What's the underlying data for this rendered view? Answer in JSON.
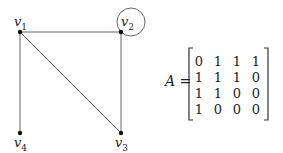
{
  "graph": {
    "vertices": [
      {
        "id": "v1",
        "name": "v",
        "sub": "1",
        "x": 20,
        "y": 32
      },
      {
        "id": "v2",
        "name": "v",
        "sub": "2",
        "x": 121,
        "y": 32
      },
      {
        "id": "v3",
        "name": "v",
        "sub": "3",
        "x": 121,
        "y": 133
      },
      {
        "id": "v4",
        "name": "v",
        "sub": "4",
        "x": 20,
        "y": 133
      }
    ],
    "edges": [
      [
        "v1",
        "v2"
      ],
      [
        "v1",
        "v3"
      ],
      [
        "v1",
        "v4"
      ],
      [
        "v2",
        "v3"
      ],
      [
        "v2",
        "v2"
      ]
    ],
    "edge_color": "#555555"
  },
  "matrix": {
    "name": "A",
    "equals": "=",
    "rows": [
      [
        "0",
        "1",
        "1",
        "1"
      ],
      [
        "1",
        "1",
        "1",
        "0"
      ],
      [
        "1",
        "1",
        "0",
        "0"
      ],
      [
        "1",
        "0",
        "0",
        "0"
      ]
    ]
  }
}
